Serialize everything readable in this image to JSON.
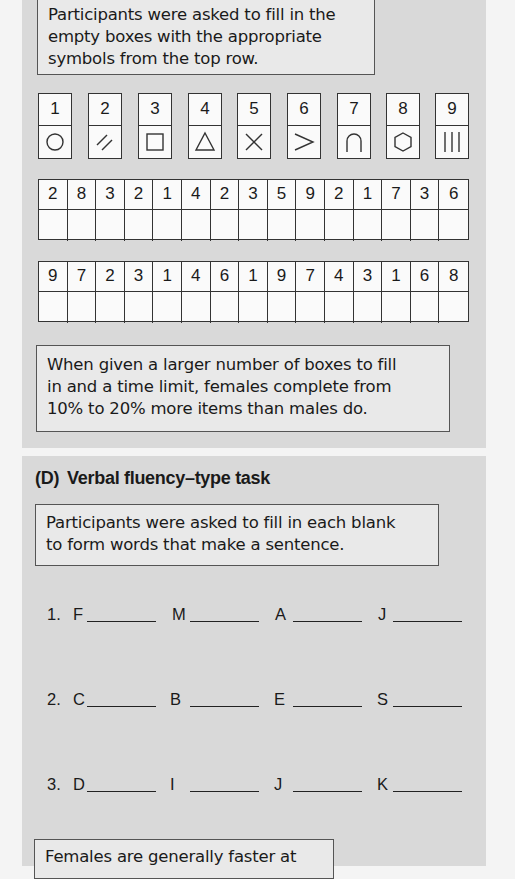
{
  "panel_c": {
    "instruction_lines": [
      "Participants were asked to fill in the",
      "empty boxes with the appropriate",
      "symbols from the top row."
    ],
    "key": [
      {
        "number": "1",
        "symbol": "circle-icon"
      },
      {
        "number": "2",
        "symbol": "double-slash-icon"
      },
      {
        "number": "3",
        "symbol": "square-icon"
      },
      {
        "number": "4",
        "symbol": "triangle-icon"
      },
      {
        "number": "5",
        "symbol": "cross-icon"
      },
      {
        "number": "6",
        "symbol": "greater-than-icon"
      },
      {
        "number": "7",
        "symbol": "arch-icon"
      },
      {
        "number": "8",
        "symbol": "hexagon-icon"
      },
      {
        "number": "9",
        "symbol": "triple-bar-icon"
      }
    ],
    "grids": [
      {
        "numbers": [
          "2",
          "8",
          "3",
          "2",
          "1",
          "4",
          "2",
          "3",
          "5",
          "9",
          "2",
          "1",
          "7",
          "3",
          "6"
        ]
      },
      {
        "numbers": [
          "9",
          "7",
          "2",
          "3",
          "1",
          "4",
          "6",
          "1",
          "9",
          "7",
          "4",
          "3",
          "1",
          "6",
          "8"
        ]
      }
    ],
    "result_lines": [
      "When given a larger number of boxes to fill",
      "in and a time limit, females complete from",
      "10% to 20% more items than males do."
    ]
  },
  "panel_d": {
    "heading_label": "(D)",
    "heading_title": "Verbal fluency–type task",
    "instruction_lines": [
      "Participants were asked to fill in each blank",
      "to form words that make a sentence."
    ],
    "rows": [
      {
        "number": "1.",
        "letters": [
          "F",
          "M",
          "A",
          "J"
        ]
      },
      {
        "number": "2.",
        "letters": [
          "C",
          "B",
          "E",
          "S"
        ]
      },
      {
        "number": "3.",
        "letters": [
          "D",
          "I",
          "J",
          "K"
        ]
      }
    ],
    "result_lines": [
      "Females are generally faster at"
    ]
  }
}
